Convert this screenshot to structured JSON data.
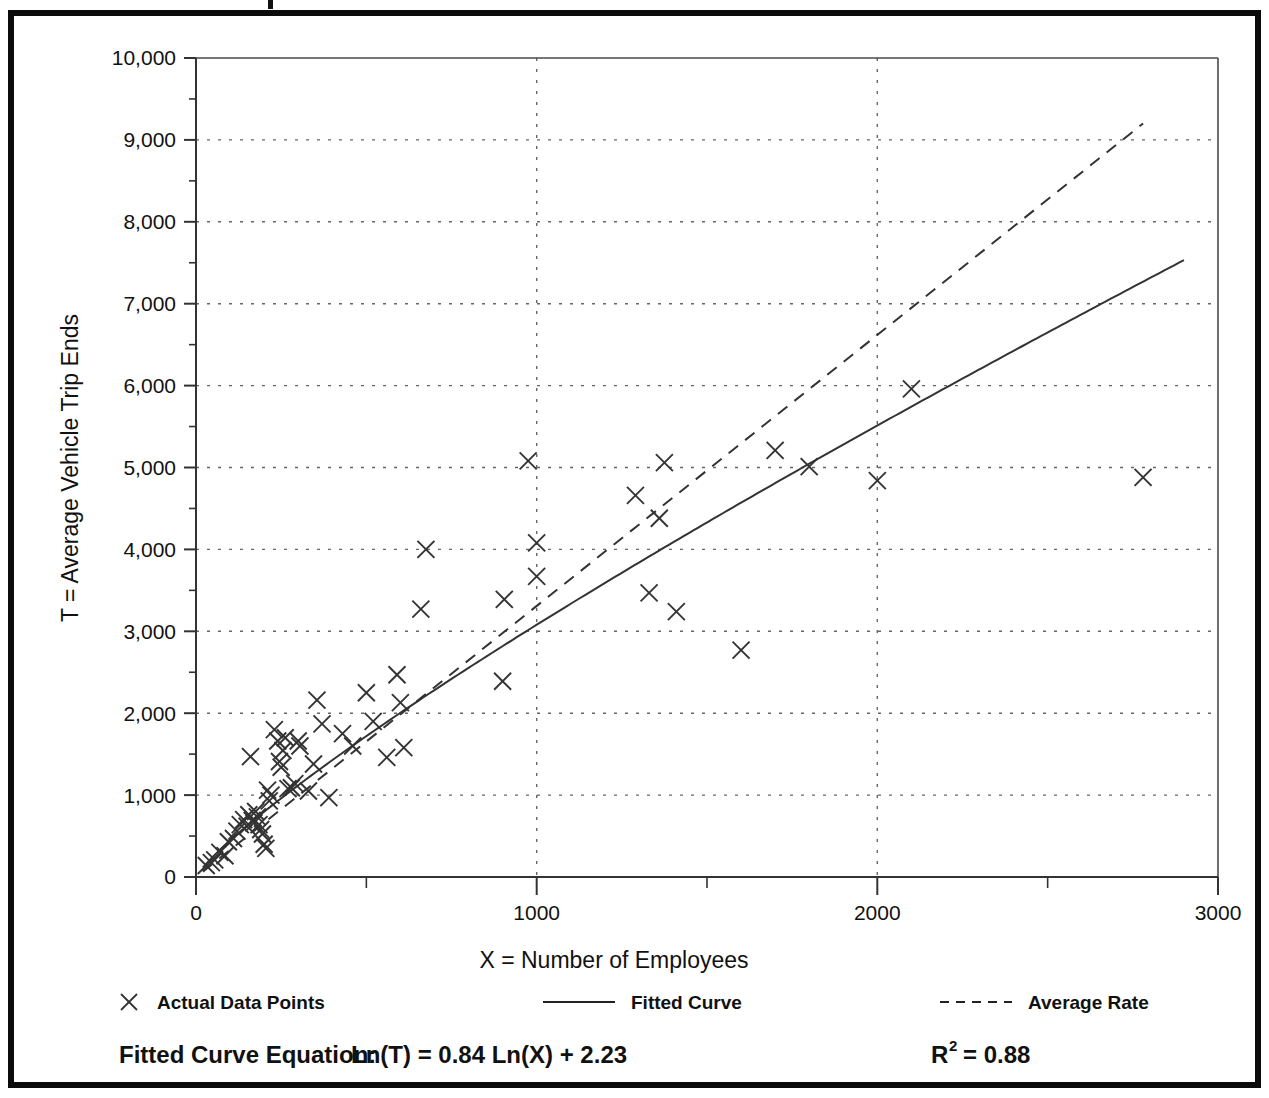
{
  "figure": {
    "frame_color": "#0b0b0b",
    "background": "#ffffff"
  },
  "chart_data": {
    "type": "scatter",
    "title": "",
    "xlabel": "X = Number of Employees",
    "ylabel": "T = Average Vehicle Trip Ends",
    "xlim": [
      0,
      3000
    ],
    "ylim": [
      0,
      10000
    ],
    "grid": true,
    "grid_style": "dotted",
    "x_major_ticks": [
      0,
      1000,
      2000,
      3000
    ],
    "x_tick_labels": [
      "0",
      "1000",
      "2000",
      "3000"
    ],
    "x_minor_tick_interval": 500,
    "y_major_ticks": [
      0,
      1000,
      2000,
      3000,
      4000,
      5000,
      6000,
      7000,
      8000,
      9000,
      10000
    ],
    "y_tick_labels": [
      "0",
      "1,000",
      "2,000",
      "3,000",
      "4,000",
      "5,000",
      "6,000",
      "7,000",
      "8,000",
      "9,000",
      "10,000"
    ],
    "y_minor_tick_interval": 500,
    "legend_position": "below-axis",
    "series": [
      {
        "name": "Actual Data Points",
        "type": "scatter",
        "marker": "x",
        "color": "#333333",
        "points": [
          [
            30,
            140
          ],
          [
            45,
            175
          ],
          [
            55,
            210
          ],
          [
            70,
            300
          ],
          [
            85,
            260
          ],
          [
            95,
            430
          ],
          [
            110,
            470
          ],
          [
            120,
            560
          ],
          [
            130,
            640
          ],
          [
            140,
            700
          ],
          [
            150,
            620
          ],
          [
            155,
            760
          ],
          [
            160,
            1470
          ],
          [
            165,
            690
          ],
          [
            170,
            660
          ],
          [
            175,
            800
          ],
          [
            180,
            735
          ],
          [
            185,
            640
          ],
          [
            190,
            580
          ],
          [
            195,
            525
          ],
          [
            200,
            400
          ],
          [
            205,
            350
          ],
          [
            210,
            1060
          ],
          [
            215,
            930
          ],
          [
            220,
            1000
          ],
          [
            230,
            1800
          ],
          [
            240,
            1660
          ],
          [
            245,
            1410
          ],
          [
            250,
            1340
          ],
          [
            255,
            1545
          ],
          [
            262,
            1700
          ],
          [
            270,
            1080
          ],
          [
            280,
            1090
          ],
          [
            290,
            1140
          ],
          [
            300,
            1660
          ],
          [
            305,
            1600
          ],
          [
            330,
            1050
          ],
          [
            345,
            1380
          ],
          [
            355,
            2160
          ],
          [
            370,
            1870
          ],
          [
            390,
            970
          ],
          [
            430,
            1750
          ],
          [
            460,
            1600
          ],
          [
            500,
            2250
          ],
          [
            520,
            1900
          ],
          [
            560,
            1460
          ],
          [
            590,
            2470
          ],
          [
            600,
            2130
          ],
          [
            610,
            1580
          ],
          [
            660,
            3270
          ],
          [
            675,
            4000
          ],
          [
            900,
            2390
          ],
          [
            905,
            3390
          ],
          [
            975,
            5080
          ],
          [
            1000,
            3670
          ],
          [
            1000,
            4080
          ],
          [
            1290,
            4660
          ],
          [
            1330,
            3470
          ],
          [
            1360,
            4380
          ],
          [
            1375,
            5060
          ],
          [
            1410,
            3240
          ],
          [
            1600,
            2770
          ],
          [
            1700,
            5210
          ],
          [
            1800,
            5010
          ],
          [
            2000,
            4840
          ],
          [
            2100,
            5960
          ],
          [
            2780,
            4880
          ]
        ]
      },
      {
        "name": "Fitted Curve",
        "type": "line",
        "style": "solid",
        "color": "#333333",
        "equation": "Ln(T) = 0.84 Ln(X) + 2.23",
        "slope_ln": 0.84,
        "intercept_ln": 2.23,
        "x_range": [
          20,
          2900
        ]
      },
      {
        "name": "Average Rate",
        "type": "line",
        "style": "dashed",
        "color": "#333333",
        "x_range": [
          20,
          2780
        ],
        "y_range": [
          66,
          9200
        ]
      }
    ],
    "annotations": {
      "equation_label": "Fitted Curve Equation:",
      "equation_value": "Ln(T) = 0.84 Ln(X) + 2.23",
      "r_squared_base": "R",
      "r_squared_exponent": "2",
      "r_squared_value": "= 0.88"
    }
  },
  "legend": {
    "items": [
      {
        "label": "Actual Data Points",
        "marker": "x-marker",
        "icon": "cross-icon"
      },
      {
        "label": "Fitted Curve",
        "marker": "solid-line",
        "icon": "solid-line-icon"
      },
      {
        "label": "Average Rate",
        "marker": "dashed-line",
        "icon": "dashed-line-icon"
      }
    ]
  }
}
